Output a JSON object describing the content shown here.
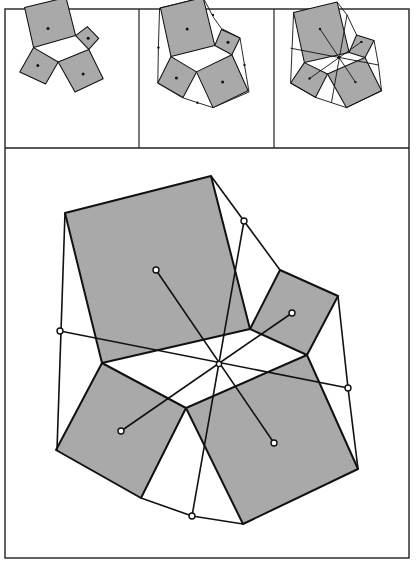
{
  "figure": {
    "colors": {
      "square_fill": "#a9a9a9",
      "stroke": "#111111",
      "background": "#ffffff",
      "frame": "#222222"
    },
    "panels": [
      {
        "id": "panel-1",
        "label": "squares-with-centers"
      },
      {
        "id": "panel-2",
        "label": "squares-with-outer-hull-midpoints"
      },
      {
        "id": "panel-3",
        "label": "squares-with-concurrent-segments"
      },
      {
        "id": "panel-main",
        "label": "enlarged-construction"
      }
    ]
  }
}
